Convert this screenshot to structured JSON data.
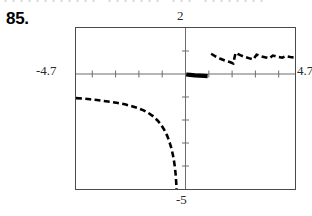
{
  "page": {
    "bleed_text": "............ ....... ... ........",
    "problem_number": "85."
  },
  "calculator": {
    "window": {
      "xmin_label": "-4.7",
      "xmax_label": "4.7",
      "ymin_label": "-5",
      "ymax_label": "2"
    }
  },
  "chart_data": {
    "type": "line",
    "title": "",
    "xlabel": "",
    "ylabel": "",
    "xlim": [
      -4.7,
      4.7
    ],
    "ylim": [
      -5,
      2
    ],
    "grid": false,
    "legend": null,
    "axis_style": "tick-marks",
    "x_tick_interval": 1,
    "y_tick_interval": 1,
    "x_ticks": [
      -4,
      -3,
      -2,
      -1,
      0,
      1,
      2,
      3,
      4
    ],
    "y_ticks": [
      -4,
      -3,
      -2,
      -1,
      0,
      1
    ],
    "line_style": "dashed",
    "line_color": "#000000",
    "line_width": 2.6,
    "asymptote": {
      "type": "vertical",
      "x": 0
    },
    "series": [
      {
        "name": "left-branch",
        "comment": "decreasing from about y=-1.05 at x=-4.7, falling steeply to -5 as x approaches 0 from the left",
        "points": [
          [
            -4.7,
            -1.05
          ],
          [
            -4.4,
            -1.07
          ],
          [
            -4.1,
            -1.1
          ],
          [
            -3.8,
            -1.13
          ],
          [
            -3.5,
            -1.17
          ],
          [
            -3.2,
            -1.21
          ],
          [
            -2.9,
            -1.26
          ],
          [
            -2.6,
            -1.32
          ],
          [
            -2.3,
            -1.4
          ],
          [
            -2.0,
            -1.5
          ],
          [
            -1.8,
            -1.58
          ],
          [
            -1.6,
            -1.69
          ],
          [
            -1.4,
            -1.83
          ],
          [
            -1.2,
            -2.02
          ],
          [
            -1.05,
            -2.2
          ],
          [
            -0.9,
            -2.45
          ],
          [
            -0.78,
            -2.7
          ],
          [
            -0.68,
            -2.98
          ],
          [
            -0.6,
            -3.25
          ],
          [
            -0.54,
            -3.52
          ],
          [
            -0.49,
            -3.8
          ],
          [
            -0.45,
            -4.1
          ],
          [
            -0.42,
            -4.4
          ],
          [
            -0.4,
            -4.7
          ],
          [
            -0.385,
            -5.0
          ]
        ]
      },
      {
        "name": "right-branch-near-axis",
        "comment": "thick nearly flat segment just right of the y-axis lying on the x-axis",
        "points": [
          [
            0.03,
            -0.02
          ],
          [
            0.2,
            -0.04
          ],
          [
            0.4,
            -0.06
          ],
          [
            0.6,
            -0.07
          ],
          [
            0.8,
            -0.08
          ],
          [
            0.95,
            -0.09
          ]
        ]
      },
      {
        "name": "right-branch-upper",
        "comment": "series of short descending dashed arcs above the x-axis, each dropping toward the axis",
        "points": [
          [
            1.1,
            0.88
          ],
          [
            1.3,
            0.76
          ],
          [
            1.5,
            0.66
          ],
          [
            1.7,
            0.58
          ],
          [
            1.9,
            0.52
          ],
          [
            2.05,
            0.46
          ],
          [
            2.15,
            0.92
          ],
          [
            2.35,
            0.82
          ],
          [
            2.55,
            0.74
          ],
          [
            2.75,
            0.68
          ],
          [
            2.9,
            0.63
          ],
          [
            3.05,
            0.84
          ],
          [
            3.25,
            0.77
          ],
          [
            3.45,
            0.72
          ],
          [
            3.6,
            0.68
          ],
          [
            3.75,
            0.8
          ],
          [
            3.95,
            0.75
          ],
          [
            4.15,
            0.71
          ],
          [
            4.3,
            0.78
          ],
          [
            4.5,
            0.74
          ],
          [
            4.65,
            0.72
          ]
        ]
      }
    ]
  }
}
